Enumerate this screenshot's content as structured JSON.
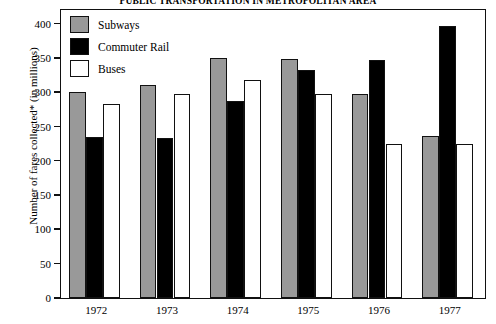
{
  "chart_data": {
    "type": "bar",
    "title": "PUBLIC TRANSPORTATION IN METROPOLITAN AREA",
    "xlabel": "",
    "ylabel": "Number of fares collected* (in millions)",
    "categories": [
      "1972",
      "1973",
      "1974",
      "1975",
      "1976",
      "1977"
    ],
    "series": [
      {
        "name": "Subways",
        "color": "#999999",
        "values": [
          300,
          310,
          350,
          348,
          297,
          237
        ]
      },
      {
        "name": "Commuter Rail",
        "color": "#000000",
        "values": [
          235,
          234,
          287,
          333,
          347,
          397
        ]
      },
      {
        "name": "Buses",
        "color": "#ffffff",
        "values": [
          283,
          297,
          318,
          297,
          225,
          225
        ]
      }
    ],
    "ylim": [
      0,
      420
    ],
    "yticks": [
      0,
      50,
      100,
      150,
      200,
      250,
      300,
      350,
      400
    ],
    "ytick_labels": [
      "0",
      "50",
      "100",
      "150",
      "200",
      "250",
      "300",
      "350",
      "400"
    ],
    "grid": false,
    "legend_position": "top-left"
  },
  "legend": {
    "items": [
      {
        "label": "Subways",
        "swatch": "subways"
      },
      {
        "label": "Commuter Rail",
        "swatch": "rail"
      },
      {
        "label": "Buses",
        "swatch": "buses"
      }
    ]
  }
}
